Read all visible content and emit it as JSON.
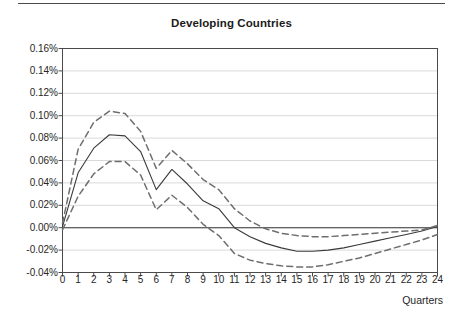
{
  "figure": {
    "title": "Developing Countries",
    "top_rule": "horizontal-rule",
    "background_color": "#ffffff"
  },
  "axes": {
    "x_axis_title": "Quarters",
    "y_tick_labels": [
      "0.16%",
      "0.14%",
      "0.12%",
      "0.10%",
      "0.08%",
      "0.06%",
      "0.04%",
      "0.02%",
      "0.00%",
      "-0.02%",
      "-0.04%"
    ],
    "x_tick_labels": [
      "0",
      "1",
      "2",
      "3",
      "4",
      "5",
      "6",
      "7",
      "8",
      "9",
      "10",
      "11",
      "12",
      "13",
      "14",
      "15",
      "16",
      "17",
      "18",
      "19",
      "20",
      "21",
      "22",
      "23",
      "24"
    ],
    "grid": "horizontal",
    "grid_color": "#d9d9d9",
    "frame_color": "#4a4a4a",
    "zero_line_color": "#3a3a3a"
  },
  "chart_data": {
    "type": "line",
    "title": "Developing Countries",
    "xlabel": "Quarters",
    "ylabel": "",
    "xlim": [
      0,
      24
    ],
    "ylim": [
      -0.04,
      0.16
    ],
    "ytick_step": 0.02,
    "grid": true,
    "legend": "none",
    "units": "percent",
    "x": [
      0,
      1,
      2,
      3,
      4,
      5,
      6,
      7,
      8,
      9,
      10,
      11,
      12,
      13,
      14,
      15,
      16,
      17,
      18,
      19,
      20,
      21,
      22,
      23,
      24
    ],
    "series": [
      {
        "name": "Point estimate",
        "style": "solid",
        "color": "#3a3a3a",
        "values": [
          0.001,
          0.049,
          0.071,
          0.083,
          0.082,
          0.068,
          0.034,
          0.052,
          0.039,
          0.024,
          0.017,
          0.0,
          -0.008,
          -0.014,
          -0.018,
          -0.021,
          -0.021,
          -0.02,
          -0.018,
          -0.015,
          -0.012,
          -0.009,
          -0.006,
          -0.003,
          0.001
        ]
      },
      {
        "name": "Upper confidence band",
        "style": "dashed",
        "color": "#6e6e6e",
        "values": [
          0.004,
          0.07,
          0.094,
          0.104,
          0.102,
          0.086,
          0.053,
          0.069,
          0.057,
          0.043,
          0.034,
          0.017,
          0.006,
          -0.001,
          -0.005,
          -0.007,
          -0.008,
          -0.008,
          -0.007,
          -0.006,
          -0.005,
          -0.004,
          -0.003,
          -0.002,
          0.002
        ]
      },
      {
        "name": "Lower confidence band",
        "style": "dashed",
        "color": "#6e6e6e",
        "values": [
          -0.002,
          0.028,
          0.048,
          0.059,
          0.059,
          0.047,
          0.016,
          0.029,
          0.018,
          0.003,
          -0.007,
          -0.023,
          -0.029,
          -0.032,
          -0.034,
          -0.035,
          -0.035,
          -0.033,
          -0.03,
          -0.027,
          -0.023,
          -0.019,
          -0.015,
          -0.011,
          -0.006
        ]
      }
    ]
  }
}
